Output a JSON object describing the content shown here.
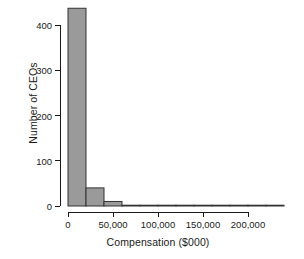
{
  "chart_data": {
    "type": "bar",
    "title": "",
    "xlabel": "Compensation ($000)",
    "ylabel": "Number of CEOs",
    "grid": false,
    "legend": false,
    "histogram": true,
    "bin_width": 20000,
    "xlim": [
      0,
      240000
    ],
    "ylim": [
      0,
      450
    ],
    "xticks": [
      0,
      50000,
      100000,
      150000,
      200000
    ],
    "xtick_labels": [
      "0",
      "50,000",
      "100,000",
      "150,000",
      "200,000"
    ],
    "yticks": [
      0,
      100,
      200,
      300,
      400
    ],
    "ytick_labels": [
      "0",
      "100",
      "200",
      "300",
      "400"
    ],
    "bin_edges": [
      0,
      20000,
      40000,
      60000,
      80000,
      100000,
      120000,
      140000,
      160000,
      180000,
      200000,
      220000,
      240000
    ],
    "categories": [
      "0-20,000",
      "20,000-40,000",
      "40,000-60,000",
      "60,000-80,000",
      "80,000-100,000",
      "100,000-120,000",
      "120,000-140,000",
      "140,000-160,000",
      "160,000-180,000",
      "180,000-200,000",
      "200,000-220,000",
      "220,000-240,000"
    ],
    "values": [
      437,
      40,
      10,
      1,
      1,
      0,
      1,
      1,
      0,
      0,
      0,
      1
    ],
    "bar_fill": "#9a9a9a",
    "bar_stroke": "#333333",
    "axis_color": "#1a1a1a",
    "background": "#ffffff"
  }
}
